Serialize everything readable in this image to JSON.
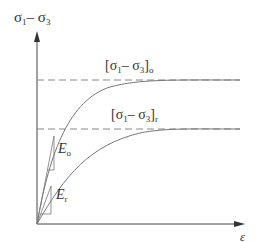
{
  "diagram": {
    "type": "stress-strain curves",
    "y_axis_label": {
      "main": "σ",
      "sub1": "1",
      "minus": "– ",
      "main2": "σ",
      "sub2": "3"
    },
    "x_axis_label": "ε",
    "curves": [
      {
        "name": "peak",
        "asymptote_label": {
          "open": "[σ",
          "sub1": "1",
          "mid": "– σ",
          "sub2": "3",
          "close": "]",
          "sub3": "o"
        },
        "modulus_label": {
          "main": "E",
          "sub": "o"
        }
      },
      {
        "name": "residual",
        "asymptote_label": {
          "open": "[σ",
          "sub1": "1",
          "mid": "– σ",
          "sub2": "3",
          "close": "]",
          "sub3": "r"
        },
        "modulus_label": {
          "main": "E",
          "sub": "r"
        }
      }
    ],
    "colors": {
      "axis": "#444444",
      "curve": "#777777",
      "dash": "#888888",
      "text": "#333333"
    }
  }
}
